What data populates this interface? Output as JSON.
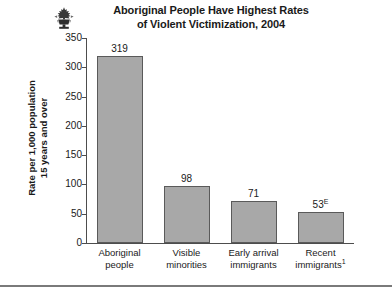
{
  "header": {
    "logo_icon": "maple-leaf-emblem-icon",
    "title_line_1": "Aboriginal People Have Highest Rates",
    "title_line_2": "of Violent Victimization, 2004"
  },
  "axis": {
    "y_title_line_1": "Rate per 1,000 population",
    "y_title_line_2": "15 years and over"
  },
  "categories": [
    {
      "line1": "Aboriginal",
      "line2": "people",
      "footnote": ""
    },
    {
      "line1": "Visible",
      "line2": "minorities",
      "footnote": ""
    },
    {
      "line1": "Early arrival",
      "line2": "immigrants",
      "footnote": ""
    },
    {
      "line1": "Recent",
      "line2": "immigrants",
      "footnote": "1"
    }
  ],
  "bar_labels": [
    {
      "value": "319",
      "marker": ""
    },
    {
      "value": "98",
      "marker": ""
    },
    {
      "value": "71",
      "marker": ""
    },
    {
      "value": "53",
      "marker": "E"
    }
  ],
  "footer": {
    "note": ""
  },
  "colors": {
    "bar_fill": "#a8a8a8",
    "bar_stroke": "#5a5a5a",
    "axis": "#4d4d4d",
    "text": "#1a1a1a",
    "rule": "#7a7a7a"
  },
  "chart_data": {
    "type": "bar",
    "title": "Aboriginal People Have Highest Rates of Violent Victimization, 2004",
    "xlabel": "",
    "ylabel": "Rate per 1,000 population 15 years and over",
    "categories": [
      "Aboriginal people",
      "Visible minorities",
      "Early arrival immigrants",
      "Recent immigrants"
    ],
    "values": [
      319,
      98,
      71,
      53
    ],
    "data_labels": [
      "319",
      "98",
      "71",
      "53E"
    ],
    "ylim": [
      0,
      350
    ],
    "yticks": [
      0,
      50,
      100,
      150,
      200,
      250,
      300,
      350
    ],
    "ytick_labels": [
      "0",
      "50",
      "100",
      "150",
      "200",
      "250",
      "300",
      "350"
    ],
    "grid": false,
    "legend": "none",
    "annotations": [
      "E = use with caution (estimate quality marker on Recent immigrants value 53)",
      "1 = footnote marker on Recent immigrants category"
    ]
  }
}
